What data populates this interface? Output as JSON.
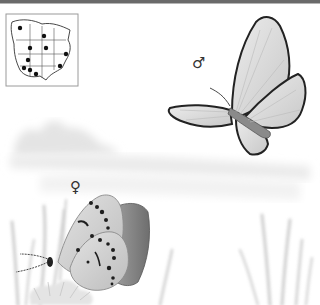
{
  "illustration": {
    "subject": "butterfly species plate",
    "range_map": {
      "label": "range-map",
      "dots": [
        [
          14,
          14
        ],
        [
          38,
          22
        ],
        [
          24,
          34
        ],
        [
          40,
          34
        ],
        [
          60,
          40
        ],
        [
          20,
          46
        ],
        [
          18,
          52
        ],
        [
          54,
          52
        ],
        [
          24,
          56
        ],
        [
          30,
          60
        ]
      ]
    },
    "male": {
      "symbol": "♂"
    },
    "female": {
      "symbol": "♀"
    },
    "colors": {
      "wing_fill": "#d9d9d9",
      "wing_border": "#2a2a2a",
      "spot": "#1e1e1e",
      "hindwing_dark": "#8c8c8c",
      "landscape": "#e6e6e6",
      "grass": "#cfcfcf",
      "top_rule": "#6a6a6a"
    }
  }
}
